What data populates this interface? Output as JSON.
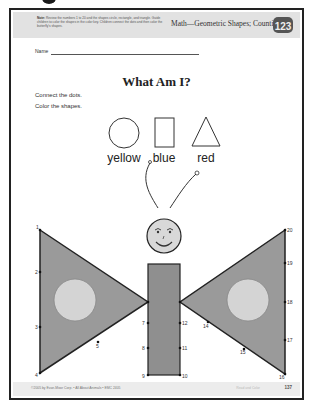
{
  "header": {
    "note_label": "Note:",
    "note_text": "Review the numbers 1 to 20 and the shapes circle, rectangle, and triangle. Guide children to color the shapes in the color key. Children connect the dots and then color the butterfly's shapes.",
    "subject": "Math—Geometric Shapes; Counting",
    "badge": "123"
  },
  "name_label": "Name",
  "title": "What Am I?",
  "instructions": [
    "Connect the dots.",
    "Color the shapes."
  ],
  "color_key": [
    {
      "shape": "circle",
      "label": "yellow"
    },
    {
      "shape": "rectangle",
      "label": "blue"
    },
    {
      "shape": "triangle",
      "label": "red"
    }
  ],
  "dots": [
    {
      "n": "1",
      "x": 40,
      "y": 230
    },
    {
      "n": "2",
      "x": 40,
      "y": 272
    },
    {
      "n": "3",
      "x": 40,
      "y": 327
    },
    {
      "n": "4",
      "x": 40,
      "y": 373
    },
    {
      "n": "5",
      "x": 98,
      "y": 342
    },
    {
      "n": "6",
      "x": 148,
      "y": 302
    },
    {
      "n": "7",
      "x": 148,
      "y": 323
    },
    {
      "n": "8",
      "x": 148,
      "y": 348
    },
    {
      "n": "9",
      "x": 148,
      "y": 375
    },
    {
      "n": "10",
      "x": 180,
      "y": 375
    },
    {
      "n": "11",
      "x": 180,
      "y": 348
    },
    {
      "n": "12",
      "x": 180,
      "y": 323
    },
    {
      "n": "13",
      "x": 180,
      "y": 302
    },
    {
      "n": "14",
      "x": 208,
      "y": 322
    },
    {
      "n": "15",
      "x": 244,
      "y": 349
    },
    {
      "n": "16",
      "x": 285,
      "y": 374
    },
    {
      "n": "17",
      "x": 285,
      "y": 340
    },
    {
      "n": "18",
      "x": 285,
      "y": 302
    },
    {
      "n": "19",
      "x": 285,
      "y": 263
    },
    {
      "n": "20",
      "x": 285,
      "y": 230
    }
  ],
  "footer": {
    "copyright": "©2005 by Evan-Moor Corp. • All About Animals • EMC 2405",
    "right_text": "Read and Color",
    "page_number": "137"
  },
  "colors": {
    "wing_fill": "#9a9a9a",
    "wing_circle": "#d4d4d4",
    "body_fill": "#8f8f8f",
    "head_fill": "#d8d8d8",
    "header_band": "#e2e2e2",
    "border": "#222222"
  }
}
